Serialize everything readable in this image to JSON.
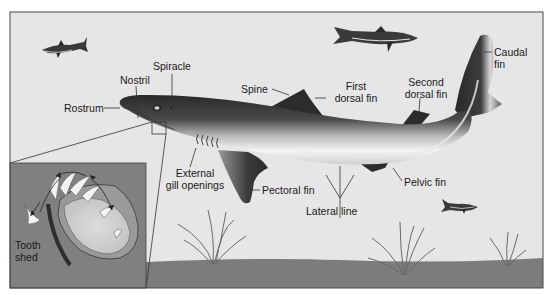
{
  "diagram": {
    "colors": {
      "water": "#e6e6e6",
      "ground": "#7a7a7a",
      "frame": "#4a4a4a",
      "shark_dark": "#2e2e2e",
      "shark_light": "#f2f2f2",
      "inset_bg": "#808080"
    },
    "labels": {
      "rostrum": "Rostrum",
      "nostril": "Nostril",
      "spiracle": "Spiracle",
      "spine": "Spine",
      "first_dorsal_fin_1": "First",
      "first_dorsal_fin_2": "dorsal fin",
      "second_dorsal_fin_1": "Second",
      "second_dorsal_fin_2": "dorsal fin",
      "caudal_fin_1": "Caudal",
      "caudal_fin_2": "fin",
      "external_gill_openings_1": "External",
      "external_gill_openings_2": "gill openings",
      "pectoral_fin": "Pectoral fin",
      "lateral_line": "Lateral line",
      "pelvic_fin": "Pelvic fin"
    },
    "inset": {
      "label_1": "Tooth",
      "label_2": "shed"
    }
  }
}
